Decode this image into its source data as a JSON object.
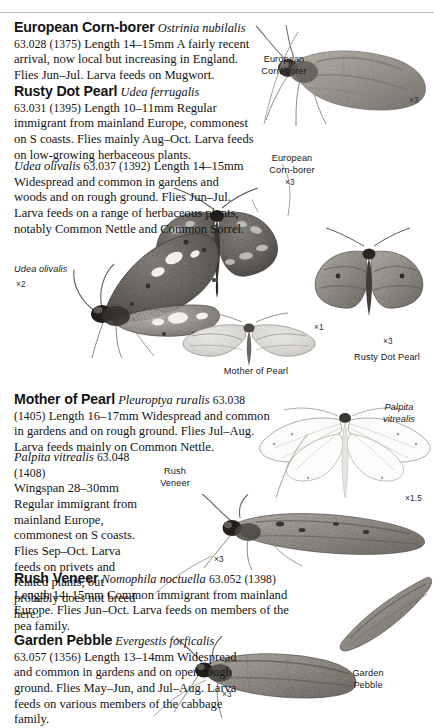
{
  "page": {
    "folio": "34",
    "running_head": "GRASS MOTHS AND MICRO-MOTHS"
  },
  "entries": [
    {
      "id": "european-corn-borer",
      "common_name": "European Corn-borer",
      "scientific_name": "Ostrinia nubilalis",
      "code": "63.028 (1375)",
      "text": "Length 14–15mm A fairly recent arrival, now local but increasing in England. Flies Jun–Jul. Larva feeds on Mugwort."
    },
    {
      "id": "rusty-dot-pearl",
      "common_name": "Rusty Dot Pearl",
      "scientific_name": "Udea ferrugalis",
      "code": "63.031 (1395)",
      "text": "Length 10–11mm Regular immigrant from mainland Europe, commonest on S coasts. Flies mainly Aug–Oct. Larva feeds on low-growing herbaceous plants."
    },
    {
      "id": "udea-olivalis",
      "common_name": "",
      "scientific_name": "Udea olivalis",
      "code": "63.037 (1392)",
      "text": "Length 14–15mm Widespread and common in gardens and woods and on rough ground. Flies Jun–Jul. Larva feeds on a range of herbaceous plants, notably Common Nettle and Common Sorrel."
    },
    {
      "id": "mother-of-pearl",
      "common_name": "Mother of Pearl",
      "scientific_name": "Pleuroptya ruralis",
      "code": "63.038 (1405)",
      "text": "Length 16–17mm Widespread and common in gardens and on rough ground. Flies Jul–Aug. Larva feeds mainly on Common Nettle."
    },
    {
      "id": "palpita-vitrealis",
      "common_name": "",
      "scientific_name": "Palpita vitrealis",
      "code": "63.048 (1408)",
      "text": "Wingspan 28–30mm Regular immigrant from mainland Europe, commonest on S coasts. Flies Sep–Oct. Larva feeds on privets and related plants, but probably does not breed here."
    },
    {
      "id": "rush-veneer",
      "common_name": "Rush Veneer",
      "scientific_name": "Nomophila noctuella",
      "code": "63.052 (1398)",
      "text": "Length 14–15mm Common immigrant from mainland Europe. Flies Jun–Oct. Larva feeds on members of the pea family."
    },
    {
      "id": "garden-pebble",
      "common_name": "Garden Pebble",
      "scientific_name": "Evergestis forficalis",
      "code": "63.057 (1356)",
      "text": "Length 13–14mm Widespread and common in gardens and on open rough ground. Flies May–Jun, and Jul–Aug. Larva feeds on various members of the cabbage family."
    }
  ],
  "plate_captions": [
    {
      "id": "cap-corn-borer-1",
      "label": "European\nCorn-borer",
      "magnification": "×3",
      "italic": false
    },
    {
      "id": "cap-corn-borer-2",
      "label": "European\nCorn-borer",
      "magnification": "×3",
      "italic": false
    },
    {
      "id": "cap-udea-olivalis",
      "label": "Udea olivalis",
      "magnification": "×2",
      "italic": true
    },
    {
      "id": "cap-rusty-dot-pearl",
      "label": "Rusty Dot Pearl",
      "magnification": "×3",
      "italic": false
    },
    {
      "id": "cap-mother-of-pearl",
      "label": "Mother of Pearl",
      "magnification": "×1",
      "italic": false
    },
    {
      "id": "cap-palpita-vitrealis",
      "label": "Palpita\nvitrealis",
      "magnification": "×1.5",
      "italic": true
    },
    {
      "id": "cap-rush-veneer",
      "label": "Rush\nVeneer",
      "magnification": "×3",
      "italic": false
    },
    {
      "id": "cap-garden-pebble",
      "label": "Garden\nPebble",
      "magnification": "×3",
      "italic": false
    }
  ]
}
